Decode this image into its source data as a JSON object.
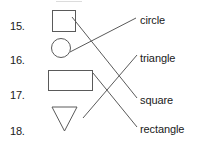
{
  "worksheet": {
    "title": "Matching exercise: shapes to names",
    "background_color": "#ffffff",
    "line_color": "#5a5a5a",
    "text_color": "#1a1a1a",
    "width": 197,
    "height": 141
  },
  "items": [
    {
      "number": "15.",
      "shape": "square",
      "shape_icon": "square-outline",
      "num_x": 10,
      "num_y": 20,
      "shape_x": 52,
      "shape_y": 10,
      "shape_w": 24,
      "shape_h": 22
    },
    {
      "number": "16.",
      "shape": "circle",
      "shape_icon": "circle-outline",
      "num_x": 10,
      "num_y": 54,
      "shape_x": 51,
      "shape_y": 38,
      "shape_w": 20,
      "shape_h": 20
    },
    {
      "number": "17.",
      "shape": "rectangle",
      "shape_icon": "rectangle-outline",
      "num_x": 10,
      "num_y": 89,
      "shape_x": 48,
      "shape_y": 70,
      "shape_w": 45,
      "shape_h": 21
    },
    {
      "number": "18.",
      "shape": "triangle",
      "shape_icon": "triangle-down-outline",
      "num_x": 10,
      "num_y": 125,
      "shape_x": 52,
      "shape_y": 106,
      "shape_w": 25,
      "shape_h": 24
    }
  ],
  "labels": [
    {
      "text": "circle",
      "x": 140,
      "y": 21
    },
    {
      "text": "triangle",
      "x": 140,
      "y": 59
    },
    {
      "text": "square",
      "x": 140,
      "y": 101
    },
    {
      "text": "rectangle",
      "x": 140,
      "y": 130
    }
  ],
  "connections": [
    {
      "from": "square",
      "to": "square",
      "x1": 72,
      "y1": 17,
      "x2": 137,
      "y2": 98,
      "name": "line-15-to-square"
    },
    {
      "from": "circle",
      "to": "circle",
      "x1": 70,
      "y1": 52,
      "x2": 136,
      "y2": 18,
      "name": "line-16-to-circle"
    },
    {
      "from": "rectangle",
      "to": "rectangle",
      "x1": 93,
      "y1": 73,
      "x2": 137,
      "y2": 127,
      "name": "line-17-to-rectangle"
    },
    {
      "from": "triangle",
      "to": "triangle",
      "x1": 83,
      "y1": 118,
      "x2": 137,
      "y2": 55,
      "name": "line-18-to-triangle"
    }
  ],
  "triangle_points": "52,107 77,107 64.5,131"
}
